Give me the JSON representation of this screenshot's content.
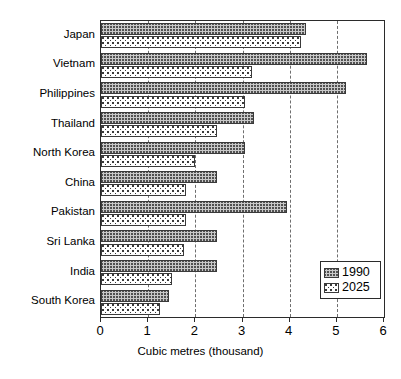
{
  "chart_data": {
    "type": "bar",
    "orientation": "horizontal",
    "title": "",
    "subtitle": "",
    "xlabel": "Cubic metres (thousand)",
    "ylabel": "",
    "xlim": [
      0,
      6
    ],
    "xticks": [
      0,
      1,
      2,
      3,
      4,
      5,
      6
    ],
    "xtick_labels": [
      "0",
      "1",
      "2",
      "3",
      "4",
      "5",
      "6"
    ],
    "grid": "vertical-dashed",
    "legend_position": "bottom-right",
    "categories": [
      "Japan",
      "Vietnam",
      "Philippines",
      "Thailand",
      "North Korea",
      "China",
      "Pakistan",
      "Sri Lanka",
      "India",
      "South Korea"
    ],
    "series": [
      {
        "name": "1990",
        "pattern": "crosshatch-gray",
        "values": [
          4.35,
          5.65,
          5.2,
          3.25,
          3.05,
          2.45,
          3.95,
          2.45,
          2.45,
          1.45
        ]
      },
      {
        "name": "2025",
        "pattern": "dotted-white",
        "values": [
          4.25,
          3.2,
          3.05,
          2.45,
          2.0,
          1.8,
          1.8,
          1.75,
          1.5,
          1.25
        ]
      }
    ]
  },
  "legend": {
    "entries": [
      {
        "label": "1990"
      },
      {
        "label": "2025"
      }
    ]
  },
  "colors": {
    "axis": "#2b2b2b",
    "grid": "#6e6e6e",
    "bar_1990_fill": "#c9c9c9",
    "bar_2025_fill": "#ffffff",
    "bar_edge": "#3a3a3a",
    "text": "#000000",
    "background": "#ffffff"
  }
}
